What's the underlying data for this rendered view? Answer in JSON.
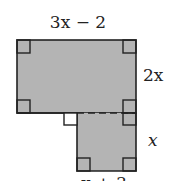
{
  "diagram": {
    "fill_color": "#b4b4b4",
    "stroke_color": "#222222",
    "labels": {
      "top": "3x − 2",
      "right_upper": "2x",
      "right_lower": "x",
      "bottom": "x + 3"
    },
    "shapes": [
      {
        "name": "upper-rectangle",
        "width_label": "3x − 2",
        "height_label": "2x"
      },
      {
        "name": "lower-square",
        "width_label": "x + 3",
        "height_label": "x"
      }
    ]
  }
}
